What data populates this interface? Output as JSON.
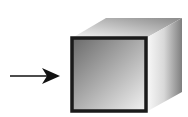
{
  "diagram": {
    "arrow": {
      "direction": "right",
      "color": "#111111"
    },
    "cube": {
      "front_face_border": "#1a1a1a",
      "front_gradient": [
        "#6a6a6a",
        "#f2f2f2"
      ],
      "top_gradient": [
        "#8a8a8a",
        "#f5f5f5"
      ],
      "side_gradient": [
        "#f8f8f8",
        "#7a7a7a"
      ]
    }
  }
}
